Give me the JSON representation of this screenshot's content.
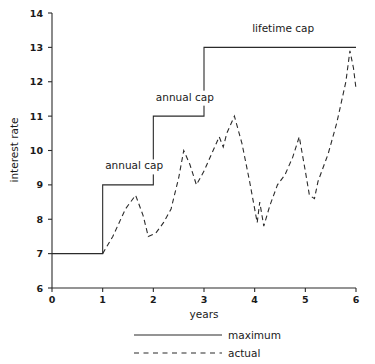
{
  "chart_data": {
    "type": "line",
    "title": "",
    "subtitle": "",
    "xlabel": "years",
    "ylabel": "interest rate",
    "xlim": [
      0,
      6
    ],
    "ylim": [
      6,
      14
    ],
    "grid": false,
    "x_ticks": [
      "0",
      "1",
      "2",
      "3",
      "4",
      "5",
      "6"
    ],
    "y_ticks": [
      "6",
      "7",
      "8",
      "9",
      "10",
      "11",
      "12",
      "13",
      "14"
    ],
    "legend_position": "bottom",
    "line_color": "#2b2b2b",
    "series": [
      {
        "name": "maximum",
        "style": "solid",
        "step": true,
        "points": [
          [
            0,
            7
          ],
          [
            1,
            7
          ],
          [
            1,
            9
          ],
          [
            2,
            9
          ],
          [
            2,
            11
          ],
          [
            3,
            11
          ],
          [
            3,
            13
          ],
          [
            6,
            13
          ]
        ]
      },
      {
        "name": "actual",
        "style": "dashed",
        "step": false,
        "points": [
          [
            1.0,
            7.0
          ],
          [
            1.2,
            7.5
          ],
          [
            1.45,
            8.3
          ],
          [
            1.65,
            8.7
          ],
          [
            1.8,
            8.1
          ],
          [
            1.9,
            7.5
          ],
          [
            2.05,
            7.6
          ],
          [
            2.2,
            7.9
          ],
          [
            2.35,
            8.3
          ],
          [
            2.5,
            9.2
          ],
          [
            2.6,
            10.0
          ],
          [
            2.72,
            9.6
          ],
          [
            2.85,
            9.0
          ],
          [
            3.0,
            9.4
          ],
          [
            3.15,
            9.9
          ],
          [
            3.3,
            10.4
          ],
          [
            3.38,
            10.1
          ],
          [
            3.45,
            10.5
          ],
          [
            3.6,
            11.0
          ],
          [
            3.75,
            10.2
          ],
          [
            3.9,
            9.1
          ],
          [
            4.05,
            7.9
          ],
          [
            4.1,
            8.5
          ],
          [
            4.18,
            7.8
          ],
          [
            4.3,
            8.4
          ],
          [
            4.45,
            9.0
          ],
          [
            4.6,
            9.3
          ],
          [
            4.75,
            9.8
          ],
          [
            4.88,
            10.4
          ],
          [
            5.0,
            9.4
          ],
          [
            5.08,
            8.7
          ],
          [
            5.18,
            8.6
          ],
          [
            5.25,
            9.1
          ],
          [
            5.45,
            9.9
          ],
          [
            5.62,
            10.8
          ],
          [
            5.8,
            12.0
          ],
          [
            5.88,
            12.9
          ],
          [
            5.95,
            12.4
          ],
          [
            6.0,
            11.8
          ]
        ]
      }
    ],
    "annotations": [
      {
        "id": "annual-cap-1",
        "text": "annual cap",
        "x": 1.05,
        "y": 9.45
      },
      {
        "id": "annual-cap-2",
        "text": "annual cap",
        "x": 2.05,
        "y": 11.45
      },
      {
        "id": "lifetime-cap",
        "text": "lifetime cap",
        "x": 3.95,
        "y": 13.45
      }
    ]
  },
  "legend": {
    "items": [
      {
        "label": "maximum",
        "style": "solid"
      },
      {
        "label": "actual",
        "style": "dashed"
      }
    ]
  },
  "axes": {
    "x_title": "years",
    "y_title": "interest rate"
  }
}
